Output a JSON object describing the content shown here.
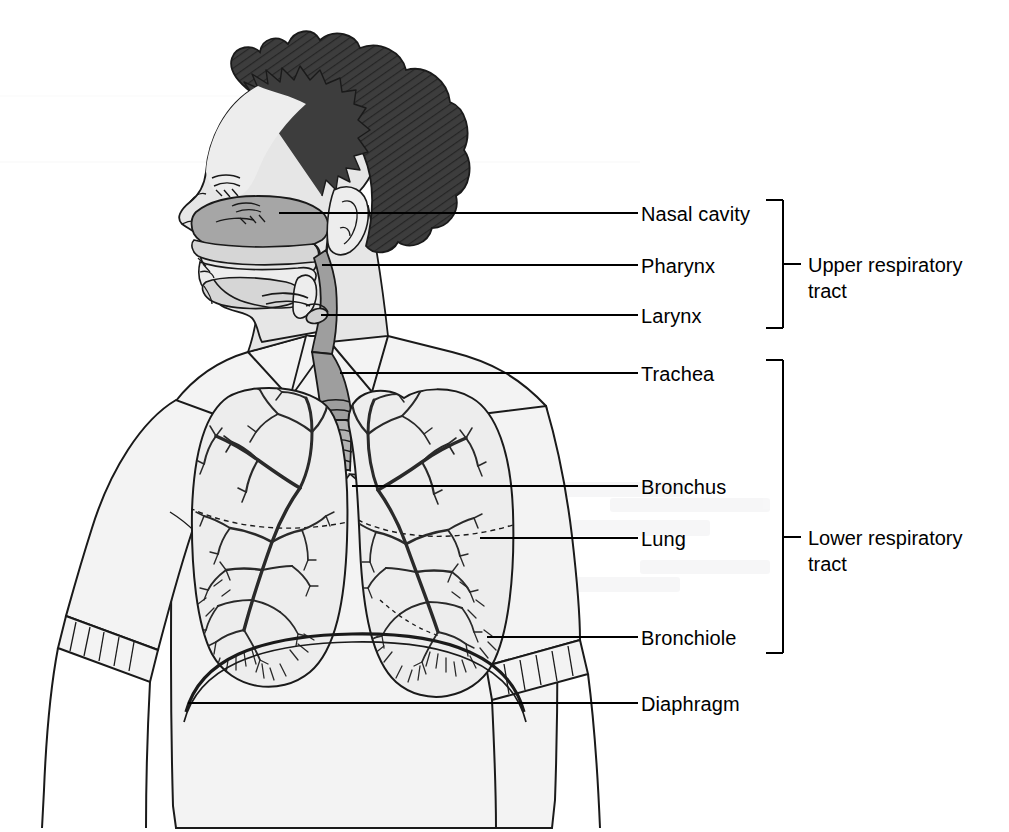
{
  "diagram": {
    "view": "anterior body with mid-sagittal head section",
    "background_color": "#ffffff",
    "line_color": "#1a1a1a",
    "hair_color": "#3a3a3a",
    "airway_fill": "#9a9a9a",
    "skin_fill": "#e0e0e0",
    "shirt_fill": "#f2f2f2",
    "lung_fill": "#ededed"
  },
  "callouts": [
    {
      "id": "nasal-cavity",
      "label": "Nasal cavity",
      "line_y": 213,
      "anchor_x": 279,
      "text_x": 641,
      "text_y": 203
    },
    {
      "id": "pharynx",
      "label": "Pharynx",
      "line_y": 265,
      "anchor_x": 322,
      "text_x": 641,
      "text_y": 255
    },
    {
      "id": "larynx",
      "label": "Larynx",
      "line_y": 315,
      "anchor_x": 321,
      "text_x": 641,
      "text_y": 305
    },
    {
      "id": "trachea",
      "label": "Trachea",
      "line_y": 373,
      "anchor_x": 340,
      "text_x": 641,
      "text_y": 363
    },
    {
      "id": "bronchus",
      "label": "Bronchus",
      "line_y": 486,
      "anchor_x": 352,
      "text_x": 641,
      "text_y": 476
    },
    {
      "id": "lung",
      "label": "Lung",
      "line_y": 538,
      "anchor_x": 480,
      "text_x": 641,
      "text_y": 528
    },
    {
      "id": "bronchiole",
      "label": "Bronchiole",
      "line_y": 637,
      "anchor_x": 487,
      "text_x": 641,
      "text_y": 627
    },
    {
      "id": "diaphragm",
      "label": "Diaphragm",
      "line_y": 703,
      "anchor_x": 188,
      "text_x": 641,
      "text_y": 693
    }
  ],
  "brackets": [
    {
      "id": "upper-respiratory-tract",
      "label_line_1": "Upper respiratory",
      "label_line_2": "tract",
      "top_y": 200,
      "bottom_y": 328,
      "spine_x": 783,
      "arm_x": 766,
      "tick_x_end": 801,
      "text_x": 808,
      "text_y": 251,
      "members": [
        "Nasal cavity",
        "Pharynx",
        "Larynx"
      ]
    },
    {
      "id": "lower-respiratory-tract",
      "label_line_1": "Lower respiratory",
      "label_line_2": "tract",
      "top_y": 360,
      "bottom_y": 653,
      "spine_x": 783,
      "arm_x": 766,
      "tick_x_end": 801,
      "text_x": 808,
      "text_y": 524,
      "members": [
        "Trachea",
        "Bronchus",
        "Lung",
        "Bronchiole"
      ]
    }
  ]
}
